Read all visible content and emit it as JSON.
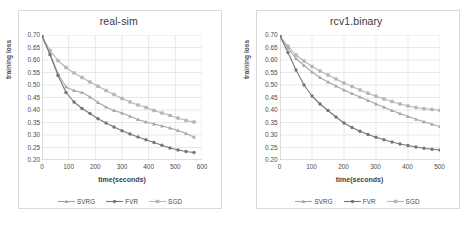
{
  "figure": {
    "background": "#ffffff",
    "panel_border": "#d9d9d9",
    "grid_color": "#d9d9d9",
    "text_color": "#4a4a4a"
  },
  "series_style": {
    "SVRG": {
      "color": "#a6a6a6",
      "marker": "triangle"
    },
    "FVR": {
      "color": "#767676",
      "marker": "circle"
    },
    "SGD": {
      "color": "#b5b5b5",
      "marker": "square"
    }
  },
  "legend": {
    "items": [
      {
        "label": "SVRG",
        "color": "#a6a6a6",
        "marker": "triangle"
      },
      {
        "label": "FVR",
        "color": "#767676",
        "marker": "circle"
      },
      {
        "label": "SGD",
        "color": "#b5b5b5",
        "marker": "square"
      }
    ]
  },
  "chart_data": [
    {
      "type": "line",
      "title": "real-sim",
      "xlabel": "time(seconds)",
      "ylabel": "training loss",
      "xlim": [
        0,
        600
      ],
      "ylim": [
        0.2,
        0.7
      ],
      "xticks": [
        0,
        100,
        200,
        300,
        400,
        500,
        600
      ],
      "xticklabels": [
        "0",
        "100",
        "200",
        "300",
        "400",
        "500",
        "600"
      ],
      "yticks": [
        0.2,
        0.25,
        0.3,
        0.35,
        0.4,
        0.45,
        0.5,
        0.55,
        0.6,
        0.65,
        0.7
      ],
      "yticklabels": [
        "0.20",
        "0.25",
        "0.30",
        "0.35",
        "0.40",
        "0.45",
        "0.50",
        "0.55",
        "0.60",
        "0.65",
        "0.70"
      ],
      "grid": true,
      "legend_position": "bottom",
      "series": [
        {
          "name": "SVRG",
          "x": [
            0,
            30,
            60,
            90,
            120,
            150,
            180,
            210,
            240,
            270,
            300,
            330,
            360,
            390,
            420,
            450,
            480,
            510,
            540,
            570
          ],
          "values": [
            0.695,
            0.625,
            0.545,
            0.492,
            0.478,
            0.47,
            0.452,
            0.43,
            0.412,
            0.398,
            0.388,
            0.375,
            0.362,
            0.352,
            0.344,
            0.336,
            0.328,
            0.318,
            0.306,
            0.292
          ]
        },
        {
          "name": "FVR",
          "x": [
            0,
            30,
            60,
            90,
            120,
            150,
            180,
            210,
            240,
            270,
            300,
            330,
            360,
            390,
            420,
            450,
            480,
            510,
            540,
            570
          ],
          "values": [
            0.695,
            0.622,
            0.538,
            0.47,
            0.432,
            0.406,
            0.386,
            0.365,
            0.348,
            0.332,
            0.317,
            0.304,
            0.292,
            0.281,
            0.27,
            0.259,
            0.248,
            0.24,
            0.234,
            0.23
          ]
        },
        {
          "name": "SGD",
          "x": [
            0,
            30,
            60,
            90,
            120,
            150,
            180,
            210,
            240,
            270,
            300,
            330,
            360,
            390,
            420,
            450,
            480,
            510,
            540,
            570
          ],
          "values": [
            0.695,
            0.638,
            0.598,
            0.57,
            0.548,
            0.53,
            0.512,
            0.495,
            0.478,
            0.462,
            0.446,
            0.432,
            0.42,
            0.41,
            0.398,
            0.388,
            0.378,
            0.368,
            0.358,
            0.352
          ]
        }
      ]
    },
    {
      "type": "line",
      "title": "rcv1.binary",
      "xlabel": "time(seconds)",
      "ylabel": "training loss",
      "xlim": [
        0,
        500
      ],
      "ylim": [
        0.2,
        0.7
      ],
      "xticks": [
        0,
        100,
        200,
        300,
        400,
        500
      ],
      "xticklabels": [
        "0",
        "100",
        "200",
        "300",
        "400",
        "500"
      ],
      "yticks": [
        0.2,
        0.25,
        0.3,
        0.35,
        0.4,
        0.45,
        0.5,
        0.55,
        0.6,
        0.65,
        0.7
      ],
      "yticklabels": [
        "0.20",
        "0.25",
        "0.30",
        "0.35",
        "0.40",
        "0.45",
        "0.50",
        "0.55",
        "0.60",
        "0.65",
        "0.70"
      ],
      "grid": true,
      "legend_position": "bottom",
      "series": [
        {
          "name": "SVRG",
          "x": [
            0,
            25,
            50,
            75,
            100,
            125,
            150,
            175,
            200,
            225,
            250,
            275,
            300,
            325,
            350,
            375,
            400,
            425,
            450,
            475,
            500
          ],
          "values": [
            0.695,
            0.648,
            0.606,
            0.578,
            0.552,
            0.53,
            0.512,
            0.496,
            0.48,
            0.466,
            0.452,
            0.438,
            0.424,
            0.411,
            0.398,
            0.386,
            0.374,
            0.363,
            0.353,
            0.343,
            0.334
          ]
        },
        {
          "name": "FVR",
          "x": [
            0,
            25,
            50,
            75,
            100,
            125,
            150,
            175,
            200,
            225,
            250,
            275,
            300,
            325,
            350,
            375,
            400,
            425,
            450,
            475,
            500
          ],
          "values": [
            0.695,
            0.63,
            0.56,
            0.5,
            0.456,
            0.424,
            0.398,
            0.372,
            0.348,
            0.33,
            0.315,
            0.302,
            0.291,
            0.281,
            0.272,
            0.264,
            0.258,
            0.252,
            0.247,
            0.243,
            0.24
          ]
        },
        {
          "name": "SGD",
          "x": [
            0,
            25,
            50,
            75,
            100,
            125,
            150,
            175,
            200,
            225,
            250,
            275,
            300,
            325,
            350,
            375,
            400,
            425,
            450,
            475,
            500
          ],
          "values": [
            0.695,
            0.655,
            0.62,
            0.596,
            0.574,
            0.556,
            0.54,
            0.524,
            0.508,
            0.494,
            0.48,
            0.467,
            0.455,
            0.444,
            0.434,
            0.424,
            0.416,
            0.41,
            0.405,
            0.402,
            0.399
          ]
        }
      ]
    }
  ]
}
